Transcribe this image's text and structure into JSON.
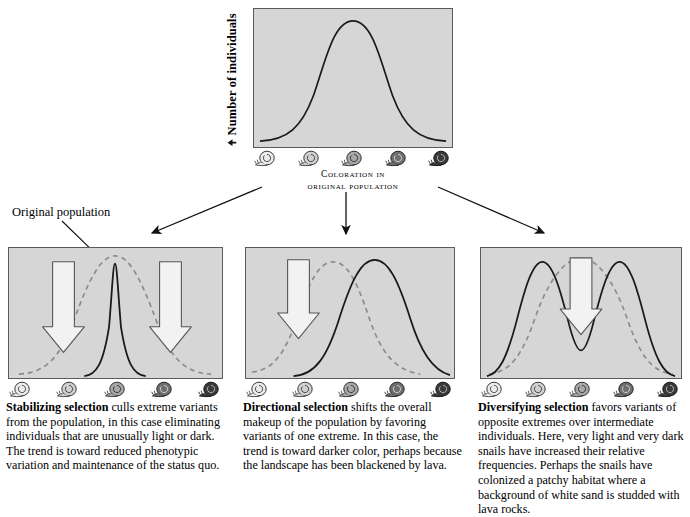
{
  "figure": {
    "top_chart": {
      "ylabel": "Number of individuals",
      "xlabel_line1": "Coloration in",
      "xlabel_line2": "original population",
      "curve_description": "normal-distribution-curve"
    },
    "original_population_label": "Original population",
    "snail_shades": [
      "#e9e9e9",
      "#d0d0d0",
      "#a8a8a8",
      "#6f6f6f",
      "#3a3a3a"
    ],
    "panels": [
      {
        "id": "stabilizing",
        "name": "Stabilizing selection",
        "arrows": 2,
        "arrow_positions": [
          "left",
          "right"
        ],
        "curve_type": "narrow-peak"
      },
      {
        "id": "directional",
        "name": "Directional selection",
        "arrows": 1,
        "arrow_positions": [
          "left"
        ],
        "curve_type": "shifted-right"
      },
      {
        "id": "diversifying",
        "name": "Diversifying selection",
        "arrows": 1,
        "arrow_positions": [
          "center"
        ],
        "curve_type": "bimodal"
      }
    ],
    "captions": {
      "stabilizing": {
        "bold": "Stabilizing selection",
        "rest": " culls extreme variants from the population, in this case eliminating individuals that are unusually light or dark. The trend is toward reduced phenotypic variation and maintenance of the status quo."
      },
      "directional": {
        "bold": "Directional selection",
        "rest": " shifts the overall makeup of the population by favoring variants of one extreme. In this case, the trend is toward darker color, perhaps because the landscape has been blackened by lava."
      },
      "diversifying": {
        "bold": "Diversifying selection",
        "rest": " favors variants of opposite extremes over intermediate individuals. Here, very light and very dark snails have increased their relative frequencies. Perhaps the snails have colonized a patchy habitat where a background of white sand is studded with lava rocks."
      }
    },
    "colors": {
      "panel_background": "#d6d6d6",
      "panel_border": "#5a5a5a",
      "curve_solid": "#1a1a1a",
      "curve_dashed": "#8c8c8c",
      "arrow_fill": "#f2f2f2",
      "arrow_stroke": "#555555"
    }
  }
}
